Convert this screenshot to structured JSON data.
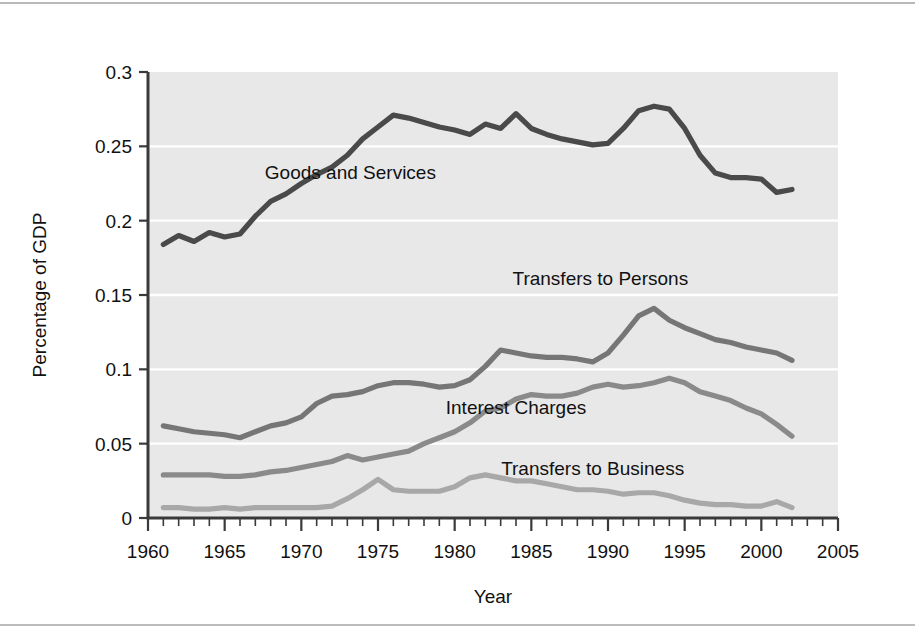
{
  "chart_data": {
    "type": "line",
    "title": "",
    "xlabel": "Year",
    "ylabel": "Percentage of GDP",
    "xlim": [
      1960,
      2005
    ],
    "ylim": [
      0,
      0.3
    ],
    "grid": true,
    "legend_position": "inline-labels",
    "x_ticks": [
      "1960",
      "1965",
      "1970",
      "1975",
      "1980",
      "1985",
      "1990",
      "1995",
      "2000",
      "2005"
    ],
    "x_tick_values": [
      1960,
      1965,
      1970,
      1975,
      1980,
      1985,
      1990,
      1995,
      2000,
      2005
    ],
    "x_minor_step": 1,
    "y_ticks": [
      "0",
      "0.05",
      "0.1",
      "0.15",
      "0.2",
      "0.25",
      "0.3"
    ],
    "y_tick_values": [
      0,
      0.05,
      0.1,
      0.15,
      0.2,
      0.25,
      0.3
    ],
    "x": [
      1961,
      1962,
      1963,
      1964,
      1965,
      1966,
      1967,
      1968,
      1969,
      1970,
      1971,
      1972,
      1973,
      1974,
      1975,
      1976,
      1977,
      1978,
      1979,
      1980,
      1981,
      1982,
      1983,
      1984,
      1985,
      1986,
      1987,
      1988,
      1989,
      1990,
      1991,
      1992,
      1993,
      1994,
      1995,
      1996,
      1997,
      1998,
      1999,
      2000,
      2001,
      2002
    ],
    "series": [
      {
        "name": "Goods and Services",
        "color": "#4a4a4a",
        "label_x": 1973.2,
        "label_y": 0.228,
        "values": [
          0.184,
          0.19,
          0.186,
          0.192,
          0.189,
          0.191,
          0.203,
          0.213,
          0.218,
          0.225,
          0.231,
          0.236,
          0.244,
          0.255,
          0.263,
          0.271,
          0.269,
          0.266,
          0.263,
          0.261,
          0.258,
          0.265,
          0.262,
          0.272,
          0.262,
          0.258,
          0.255,
          0.253,
          0.251,
          0.252,
          0.262,
          0.274,
          0.277,
          0.275,
          0.262,
          0.244,
          0.232,
          0.229,
          0.229,
          0.228,
          0.219,
          0.221
        ]
      },
      {
        "name": "Transfers to Persons",
        "color": "#767676",
        "label_x": 1989.5,
        "label_y": 0.157,
        "values": [
          0.062,
          0.06,
          0.058,
          0.057,
          0.056,
          0.054,
          0.058,
          0.062,
          0.064,
          0.068,
          0.077,
          0.082,
          0.083,
          0.085,
          0.089,
          0.091,
          0.091,
          0.09,
          0.088,
          0.089,
          0.093,
          0.102,
          0.113,
          0.111,
          0.109,
          0.108,
          0.108,
          0.107,
          0.105,
          0.111,
          0.123,
          0.136,
          0.141,
          0.133,
          0.128,
          0.124,
          0.12,
          0.118,
          0.115,
          0.113,
          0.111,
          0.106
        ]
      },
      {
        "name": "Interest Charges",
        "color": "#8a8a8a",
        "label_x": 1984.0,
        "label_y": 0.07,
        "values": [
          0.029,
          0.029,
          0.029,
          0.029,
          0.028,
          0.028,
          0.029,
          0.031,
          0.032,
          0.034,
          0.036,
          0.038,
          0.042,
          0.039,
          0.041,
          0.043,
          0.045,
          0.05,
          0.054,
          0.058,
          0.064,
          0.072,
          0.074,
          0.08,
          0.083,
          0.082,
          0.082,
          0.084,
          0.088,
          0.09,
          0.088,
          0.089,
          0.091,
          0.094,
          0.091,
          0.085,
          0.082,
          0.079,
          0.074,
          0.07,
          0.063,
          0.055
        ]
      },
      {
        "name": "Transfers to Business",
        "color": "#a8a8a8",
        "label_x": 1989.0,
        "label_y": 0.029,
        "values": [
          0.007,
          0.007,
          0.006,
          0.006,
          0.007,
          0.006,
          0.007,
          0.007,
          0.007,
          0.007,
          0.007,
          0.008,
          0.013,
          0.019,
          0.026,
          0.019,
          0.018,
          0.018,
          0.018,
          0.021,
          0.027,
          0.029,
          0.027,
          0.025,
          0.025,
          0.023,
          0.021,
          0.019,
          0.019,
          0.018,
          0.016,
          0.017,
          0.017,
          0.015,
          0.012,
          0.01,
          0.009,
          0.009,
          0.008,
          0.008,
          0.011,
          0.007
        ]
      }
    ]
  }
}
